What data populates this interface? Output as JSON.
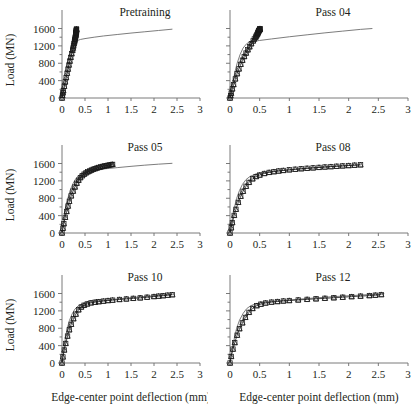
{
  "figure": {
    "kind": "multi-panel-line-chart",
    "rows": 3,
    "cols": 2,
    "shared_xlabel": "Edge-center point deflection (mm)",
    "shared_ylabel": "Load (MN)"
  },
  "axes": {
    "x_ticks": [
      "0",
      "0.5",
      "1",
      "1.5",
      "2",
      "2.5",
      "3"
    ],
    "x_tick_values": [
      0,
      0.5,
      1,
      1.5,
      2,
      2.5,
      3
    ],
    "y_ticks": [
      "0",
      "400",
      "800",
      "1200",
      "1600"
    ],
    "y_tick_values": [
      0,
      400,
      800,
      1200,
      1600
    ],
    "xlim": [
      0,
      3
    ],
    "ylim": [
      0,
      1750
    ],
    "xlabel": "Edge-center point deflection (mm)",
    "ylabel": "Load (MN)",
    "grid": "off",
    "minor_y_interval": 200
  },
  "style": {
    "line_color": "#6d6d6d",
    "marker_color": "#1a1a1a",
    "axis_color": "#6b6b6b",
    "text_color": "#231f20",
    "background": "#ffffff"
  },
  "chart_data": [
    {
      "type": "line",
      "title": "Pretraining",
      "xlabel": "",
      "ylabel": "Load (MN)",
      "xlim": [
        0,
        3
      ],
      "ylim": [
        0,
        1750
      ],
      "grid": "off",
      "legend": "none",
      "show_ylabel": true,
      "show_yticklabels": true,
      "show_xticklabels": true,
      "show_xlabel": false,
      "series": [
        {
          "name": "model curve",
          "style": "line",
          "x": [
            0,
            0.05,
            0.1,
            0.15,
            0.2,
            0.25,
            0.3,
            0.35,
            0.4,
            0.5,
            0.7,
            0.9,
            1.2,
            1.5,
            1.8,
            2.1,
            2.4
          ],
          "y": [
            0,
            260,
            520,
            760,
            980,
            1180,
            1290,
            1330,
            1348,
            1368,
            1400,
            1428,
            1462,
            1495,
            1525,
            1555,
            1585
          ]
        },
        {
          "name": "experimental data",
          "style": "markers",
          "x": [
            0,
            0.01,
            0.02,
            0.03,
            0.05,
            0.07,
            0.09,
            0.11,
            0.13,
            0.15,
            0.17,
            0.19,
            0.21,
            0.23,
            0.24,
            0.25,
            0.26,
            0.27,
            0.275,
            0.28,
            0.285,
            0.29,
            0.295,
            0.3,
            0.3,
            0.3,
            0.305,
            0.305,
            0.31,
            0.31,
            0.31,
            0.315,
            0.315,
            0.315
          ],
          "y": [
            0,
            60,
            120,
            170,
            270,
            370,
            470,
            570,
            665,
            760,
            850,
            935,
            1020,
            1100,
            1150,
            1200,
            1250,
            1290,
            1320,
            1350,
            1380,
            1405,
            1430,
            1450,
            1470,
            1490,
            1505,
            1520,
            1535,
            1548,
            1560,
            1570,
            1580,
            1590
          ]
        }
      ]
    },
    {
      "type": "line",
      "title": "Pass 04",
      "xlabel": "",
      "ylabel": "",
      "xlim": [
        0,
        3
      ],
      "ylim": [
        0,
        1750
      ],
      "grid": "off",
      "legend": "none",
      "show_ylabel": false,
      "show_yticklabels": false,
      "show_xticklabels": true,
      "show_xlabel": false,
      "series": [
        {
          "name": "model curve",
          "style": "line",
          "x": [
            0,
            0.04,
            0.08,
            0.12,
            0.17,
            0.22,
            0.28,
            0.34,
            0.4,
            0.46,
            0.5,
            0.7,
            1.0,
            1.3,
            1.6,
            1.9,
            2.2,
            2.4
          ],
          "y": [
            0,
            300,
            580,
            800,
            1000,
            1150,
            1250,
            1295,
            1310,
            1318,
            1325,
            1360,
            1410,
            1455,
            1500,
            1540,
            1580,
            1600
          ]
        },
        {
          "name": "experimental data",
          "style": "markers",
          "x": [
            0,
            0.01,
            0.02,
            0.04,
            0.06,
            0.09,
            0.12,
            0.15,
            0.18,
            0.21,
            0.24,
            0.27,
            0.3,
            0.33,
            0.36,
            0.39,
            0.41,
            0.43,
            0.44,
            0.45,
            0.46,
            0.465,
            0.47,
            0.475,
            0.48,
            0.485,
            0.49,
            0.495,
            0.5,
            0.5,
            0.505,
            0.505
          ],
          "y": [
            0,
            55,
            110,
            210,
            310,
            440,
            560,
            670,
            775,
            870,
            955,
            1035,
            1110,
            1180,
            1250,
            1315,
            1360,
            1400,
            1425,
            1450,
            1470,
            1490,
            1505,
            1520,
            1535,
            1548,
            1558,
            1568,
            1578,
            1585,
            1592,
            1598
          ]
        }
      ]
    },
    {
      "type": "line",
      "title": "Pass 05",
      "xlabel": "",
      "ylabel": "Load (MN)",
      "xlim": [
        0,
        3
      ],
      "ylim": [
        0,
        1750
      ],
      "grid": "off",
      "legend": "none",
      "show_ylabel": true,
      "show_yticklabels": true,
      "show_xticklabels": true,
      "show_xlabel": false,
      "series": [
        {
          "name": "model curve",
          "style": "line",
          "x": [
            0,
            0.04,
            0.08,
            0.13,
            0.18,
            0.24,
            0.3,
            0.37,
            0.44,
            0.5,
            0.6,
            0.75,
            0.95,
            1.2,
            1.5,
            1.8,
            2.1,
            2.4
          ],
          "y": [
            0,
            300,
            575,
            810,
            990,
            1140,
            1250,
            1330,
            1380,
            1405,
            1430,
            1455,
            1480,
            1505,
            1535,
            1562,
            1585,
            1605
          ]
        },
        {
          "name": "experimental data",
          "style": "markers",
          "x": [
            0,
            0.02,
            0.04,
            0.07,
            0.1,
            0.13,
            0.16,
            0.2,
            0.24,
            0.28,
            0.32,
            0.36,
            0.4,
            0.44,
            0.48,
            0.52,
            0.56,
            0.6,
            0.64,
            0.68,
            0.72,
            0.76,
            0.8,
            0.84,
            0.88,
            0.92,
            0.96,
            1.0,
            1.04,
            1.08,
            1.1
          ],
          "y": [
            0,
            110,
            215,
            360,
            495,
            620,
            730,
            855,
            965,
            1060,
            1145,
            1215,
            1275,
            1320,
            1355,
            1385,
            1410,
            1430,
            1450,
            1468,
            1483,
            1497,
            1510,
            1522,
            1533,
            1543,
            1552,
            1560,
            1568,
            1575,
            1580
          ]
        }
      ]
    },
    {
      "type": "line",
      "title": "Pass 08",
      "xlabel": "",
      "ylabel": "",
      "xlim": [
        0,
        3
      ],
      "ylim": [
        0,
        1750
      ],
      "grid": "off",
      "legend": "none",
      "show_ylabel": false,
      "show_yticklabels": false,
      "show_xticklabels": true,
      "show_xlabel": false,
      "series": [
        {
          "name": "model curve",
          "style": "line",
          "x": [
            0,
            0.03,
            0.07,
            0.11,
            0.16,
            0.21,
            0.27,
            0.34,
            0.42,
            0.5,
            0.65,
            0.85,
            1.1,
            1.4,
            1.7,
            2.0,
            2.2
          ],
          "y": [
            0,
            260,
            560,
            790,
            980,
            1120,
            1230,
            1305,
            1350,
            1375,
            1405,
            1435,
            1465,
            1500,
            1530,
            1555,
            1570
          ]
        },
        {
          "name": "experimental data",
          "style": "markers",
          "x": [
            0,
            0.02,
            0.04,
            0.07,
            0.1,
            0.14,
            0.18,
            0.22,
            0.27,
            0.32,
            0.38,
            0.44,
            0.5,
            0.58,
            0.66,
            0.74,
            0.82,
            0.9,
            1.0,
            1.1,
            1.2,
            1.3,
            1.4,
            1.5,
            1.6,
            1.7,
            1.8,
            1.9,
            2.0,
            2.1,
            2.2
          ],
          "y": [
            0,
            120,
            240,
            405,
            545,
            705,
            845,
            960,
            1075,
            1165,
            1248,
            1300,
            1335,
            1370,
            1395,
            1412,
            1428,
            1440,
            1455,
            1468,
            1480,
            1490,
            1500,
            1510,
            1520,
            1528,
            1537,
            1545,
            1553,
            1562,
            1570
          ]
        }
      ]
    },
    {
      "type": "line",
      "title": "Pass 10",
      "xlabel": "Edge-center point deflection (mm)",
      "ylabel": "Load (MN)",
      "xlim": [
        0,
        3
      ],
      "ylim": [
        0,
        1750
      ],
      "grid": "off",
      "legend": "none",
      "show_ylabel": true,
      "show_yticklabels": true,
      "show_xticklabels": true,
      "show_xlabel": true,
      "series": [
        {
          "name": "model curve",
          "style": "line",
          "x": [
            0,
            0.03,
            0.07,
            0.11,
            0.16,
            0.22,
            0.28,
            0.35,
            0.43,
            0.52,
            0.65,
            0.85,
            1.1,
            1.4,
            1.7,
            2.0,
            2.2,
            2.4
          ],
          "y": [
            0,
            250,
            545,
            780,
            975,
            1130,
            1240,
            1315,
            1355,
            1382,
            1405,
            1432,
            1460,
            1495,
            1525,
            1550,
            1565,
            1578
          ]
        },
        {
          "name": "experimental data",
          "style": "markers",
          "x": [
            0,
            0.02,
            0.05,
            0.08,
            0.12,
            0.16,
            0.2,
            0.25,
            0.3,
            0.36,
            0.42,
            0.48,
            0.55,
            0.63,
            0.72,
            0.8,
            0.9,
            1.0,
            1.1,
            1.25,
            1.4,
            1.55,
            1.7,
            1.85,
            2.0,
            2.1,
            2.2,
            2.3,
            2.4
          ],
          "y": [
            0,
            140,
            300,
            450,
            620,
            765,
            890,
            1020,
            1125,
            1225,
            1290,
            1330,
            1360,
            1385,
            1400,
            1412,
            1425,
            1438,
            1448,
            1462,
            1475,
            1488,
            1500,
            1515,
            1530,
            1540,
            1550,
            1562,
            1572
          ]
        }
      ]
    },
    {
      "type": "line",
      "title": "Pass 12",
      "xlabel": "Edge-center point deflection (mm)",
      "ylabel": "",
      "xlim": [
        0,
        3
      ],
      "ylim": [
        0,
        1750
      ],
      "grid": "off",
      "legend": "none",
      "show_ylabel": false,
      "show_yticklabels": false,
      "show_xticklabels": true,
      "show_xlabel": true,
      "series": [
        {
          "name": "model curve",
          "style": "line",
          "x": [
            0,
            0.03,
            0.07,
            0.11,
            0.16,
            0.22,
            0.28,
            0.35,
            0.43,
            0.52,
            0.68,
            0.9,
            1.15,
            1.45,
            1.75,
            2.05,
            2.3,
            2.5,
            2.6
          ],
          "y": [
            0,
            250,
            550,
            790,
            985,
            1140,
            1250,
            1320,
            1360,
            1388,
            1412,
            1440,
            1468,
            1500,
            1528,
            1552,
            1572,
            1588,
            1598
          ]
        },
        {
          "name": "experimental data",
          "style": "markers",
          "x": [
            0,
            0.02,
            0.05,
            0.08,
            0.12,
            0.16,
            0.21,
            0.26,
            0.32,
            0.38,
            0.45,
            0.52,
            0.6,
            0.7,
            0.8,
            0.9,
            1.0,
            1.15,
            1.3,
            1.45,
            1.6,
            1.75,
            1.9,
            2.05,
            2.2,
            2.35,
            2.45,
            2.55
          ],
          "y": [
            0,
            150,
            320,
            470,
            640,
            790,
            925,
            1050,
            1165,
            1255,
            1320,
            1355,
            1382,
            1402,
            1415,
            1428,
            1438,
            1452,
            1465,
            1478,
            1490,
            1502,
            1515,
            1528,
            1540,
            1552,
            1562,
            1575
          ]
        }
      ]
    }
  ]
}
